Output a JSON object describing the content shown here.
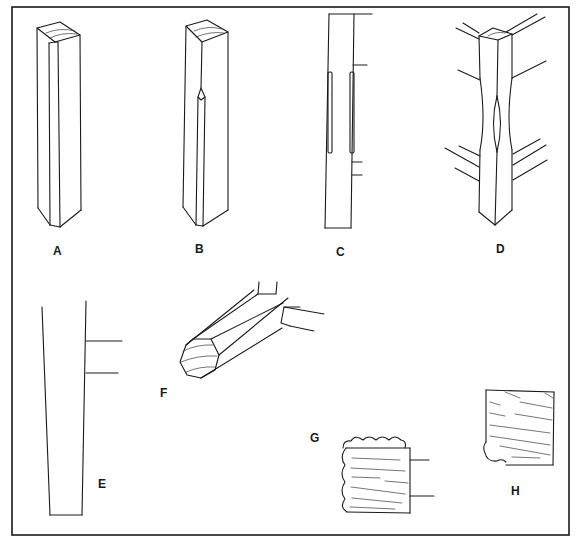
{
  "figure": {
    "type": "woodworking technical illustration",
    "ink_color": "#1a1a1a",
    "background": "#ffffff",
    "panels": [
      {
        "id": "A",
        "label": "A",
        "subject": "square post with chamfered top"
      },
      {
        "id": "B",
        "label": "B",
        "subject": "post with stopped chamfer along edge"
      },
      {
        "id": "C",
        "label": "C",
        "subject": "post side elevation with stopped chamfers and rail lines"
      },
      {
        "id": "D",
        "label": "D",
        "subject": "post with waisted middle and rails joining"
      },
      {
        "id": "E",
        "label": "E",
        "subject": "tapered leg with rail lines"
      },
      {
        "id": "F",
        "label": "F",
        "subject": "octagonal turned leg end with rails"
      },
      {
        "id": "G",
        "label": "G",
        "subject": "reeded / beaded cross-section with rails"
      },
      {
        "id": "H",
        "label": "H",
        "subject": "cross-section with corner bead"
      }
    ]
  }
}
